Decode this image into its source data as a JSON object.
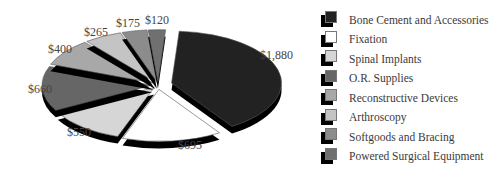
{
  "chart_data": {
    "type": "pie",
    "style": "3d-exploded",
    "title": "",
    "categories": [
      "Bone Cement and Accessories",
      "Fixation",
      "Spinal Implants",
      "O.R. Supplies",
      "Reconstructive Devices",
      "Arthroscopy",
      "Softgoods and Bracing",
      "Powered Surgical Equipment"
    ],
    "values": [
      1880,
      695,
      550,
      660,
      400,
      265,
      175,
      120
    ],
    "value_labels": [
      "$1,880",
      "$695",
      "$550",
      "$660",
      "$400",
      "$265",
      "$175",
      "$120"
    ],
    "colors": [
      "#222222",
      "#ffffff",
      "#d6d6d6",
      "#666666",
      "#a8a8a8",
      "#c4c4c4",
      "#8c8c8c",
      "#707070"
    ],
    "legend_position": "right"
  },
  "legend": {
    "items": [
      {
        "label": "Bone Cement and Accessories",
        "color": "#222222"
      },
      {
        "label": "Fixation",
        "color": "#ffffff"
      },
      {
        "label": "Spinal Implants",
        "color": "#d6d6d6"
      },
      {
        "label": "O.R. Supplies",
        "color": "#666666"
      },
      {
        "label": "Reconstructive Devices",
        "color": "#a8a8a8"
      },
      {
        "label": "Arthroscopy",
        "color": "#c4c4c4"
      },
      {
        "label": "Softgoods and Bracing",
        "color": "#8c8c8c"
      },
      {
        "label": "Powered Surgical Equipment",
        "color": "#707070"
      }
    ]
  },
  "labels": {
    "l0": "$1,880",
    "l1": "$695",
    "l2": "$550",
    "l3": "$660",
    "l4": "$400",
    "l5": "$265",
    "l6": "$175",
    "l7": "$120"
  }
}
